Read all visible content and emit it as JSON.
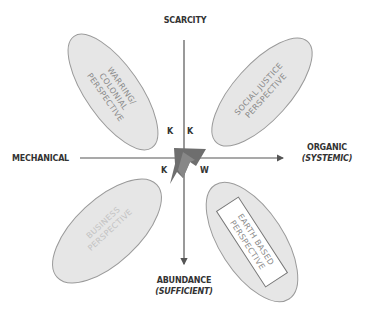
{
  "diagram": {
    "axes": {
      "top": {
        "label": "SCARCITY"
      },
      "bottom": {
        "label": "ABUNDANCE",
        "sublabel": "(SUFFICIENT)"
      },
      "left": {
        "label": "MECHANICAL"
      },
      "right": {
        "label": "ORGANIC",
        "sublabel": "(SYSTEMIC)"
      }
    },
    "quadrant_letters": {
      "upper_left": "K",
      "upper_right": "K",
      "lower_left": "K",
      "lower_right": "W"
    },
    "perspectives": [
      {
        "position": "upper-left",
        "lines": [
          "WARRING/",
          "COLONIAL",
          "PERSPECTIVE"
        ]
      },
      {
        "position": "upper-right",
        "lines": [
          "SOCIAL JUSTICE",
          "PERSPECTIVE"
        ]
      },
      {
        "position": "lower-left",
        "lines": [
          "BUSINESS",
          "PERSPECTIVE"
        ]
      },
      {
        "position": "lower-right",
        "lines": [
          "EARTH BASED",
          "PERSPECTIVE"
        ],
        "boxed": true
      }
    ],
    "colors": {
      "ellipse_fill": "#e6e6e6",
      "ellipse_stroke": "#9a9a9a",
      "axis": "#555555",
      "center_shape_dark": "#6e6e6e",
      "center_shape_light": "#8a8a8a"
    }
  }
}
